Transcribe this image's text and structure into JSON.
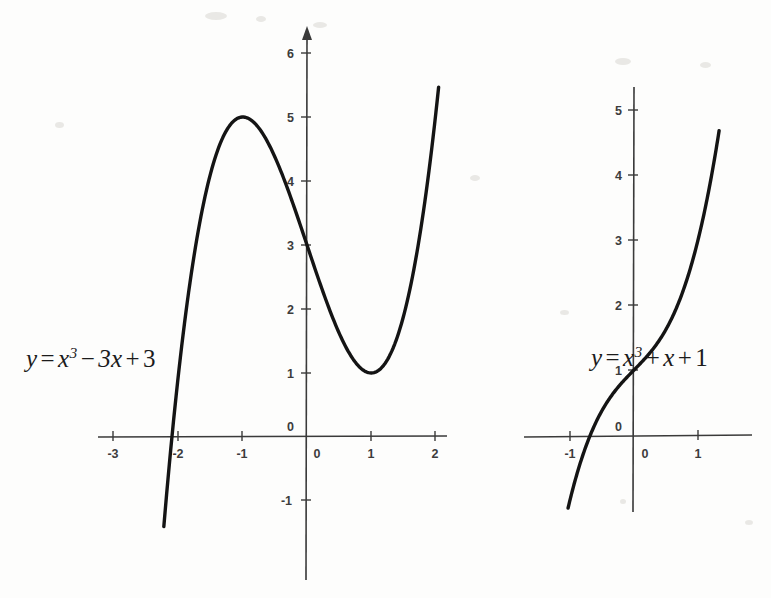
{
  "figure": {
    "background_color": "#fdfdfc",
    "curve_color": "#141414",
    "axis_color": "#3a3a3a",
    "label_color": "#3c3c3c"
  },
  "chart_data": [
    {
      "type": "line",
      "id": "left-plot",
      "title": "",
      "annotation": "y = x^3 - 3x + 3",
      "equation_parts": {
        "lhs": "y",
        "equals": "=",
        "var": "x",
        "exponent": "3",
        "term2_op": "−",
        "term2": "3x",
        "term3_op": "+",
        "term3": "3"
      },
      "function": "x^3-3x+3",
      "xlabel": "",
      "ylabel": "",
      "xlim": [
        -3.25,
        2.15
      ],
      "ylim": [
        -2.4,
        6.6
      ],
      "xticks": [
        -3,
        -2,
        -1,
        0,
        1,
        2
      ],
      "xticklabels": [
        "-3",
        "-2",
        "-1",
        "0",
        "1",
        "2"
      ],
      "yticks": [
        -1,
        0,
        1,
        2,
        3,
        4,
        5,
        6
      ],
      "yticklabels": [
        "-1",
        "0",
        "1",
        "2",
        "3",
        "4",
        "5",
        "6"
      ],
      "grid": false,
      "legend": "none",
      "axis_arrow_y": true,
      "domain_drawn": [
        -2.23,
        2.05
      ],
      "key_points": [
        {
          "label": "local maximum",
          "x": -1,
          "y": 5
        },
        {
          "label": "local minimum",
          "x": 1,
          "y": 1
        },
        {
          "label": "y-intercept",
          "x": 0,
          "y": 3
        },
        {
          "label": "x-intercept",
          "x": -2.1,
          "y": 0
        }
      ],
      "x": [
        -2.23,
        -2.0,
        -1.75,
        -1.5,
        -1.25,
        -1.0,
        -0.75,
        -0.5,
        -0.25,
        0.0,
        0.25,
        0.5,
        0.75,
        1.0,
        1.25,
        1.5,
        1.75,
        2.0,
        2.05
      ],
      "values": [
        -1.4,
        1.0,
        2.89,
        4.13,
        4.8,
        5.0,
        4.83,
        4.38,
        3.73,
        3.0,
        2.27,
        1.63,
        1.17,
        1.0,
        1.2,
        1.88,
        3.11,
        5.0,
        5.46
      ]
    },
    {
      "type": "line",
      "id": "right-plot",
      "title": "",
      "annotation": "y = x^3 + x + 1",
      "equation_parts": {
        "lhs": "y",
        "equals": "=",
        "var": "x",
        "exponent": "3",
        "term2_op": "+",
        "term2": "x",
        "term3_op": "+",
        "term3": "1"
      },
      "function": "x^3+x+1",
      "xlabel": "",
      "ylabel": "",
      "xlim": [
        -1.7,
        1.8
      ],
      "ylim": [
        -1.5,
        5.7
      ],
      "xticks": [
        -1,
        0,
        1
      ],
      "xticklabels": [
        "-1",
        "0",
        "1"
      ],
      "yticks": [
        0,
        1,
        2,
        3,
        4,
        5
      ],
      "yticklabels": [
        "0",
        "1",
        "2",
        "3",
        "4",
        "5"
      ],
      "grid": false,
      "legend": "none",
      "axis_arrow_y": false,
      "domain_drawn": [
        -1.03,
        1.33
      ],
      "key_points": [
        {
          "label": "y-intercept",
          "x": 0,
          "y": 1
        },
        {
          "label": "x-intercept",
          "x": -0.68,
          "y": 0
        },
        {
          "label": "inflection",
          "x": 0,
          "y": 1
        }
      ],
      "x": [
        -1.03,
        -0.9,
        -0.75,
        -0.6,
        -0.45,
        -0.3,
        -0.15,
        0.0,
        0.15,
        0.3,
        0.45,
        0.6,
        0.75,
        0.9,
        1.05,
        1.2,
        1.33
      ],
      "values": [
        -1.12,
        -0.63,
        -0.17,
        0.18,
        0.46,
        0.67,
        0.85,
        1.0,
        1.15,
        1.33,
        1.54,
        1.82,
        2.17,
        2.63,
        3.21,
        3.93,
        4.68
      ]
    }
  ],
  "left_plot": {
    "equation_text": "y = x³ − 3x + 3",
    "xticklabels": [
      "-3",
      "-2",
      "-1",
      "0",
      "1",
      "2"
    ],
    "yticklabels": [
      "-1",
      "0",
      "1",
      "2",
      "3",
      "4",
      "5",
      "6"
    ],
    "origin_label": "0"
  },
  "right_plot": {
    "equation_text": "y = x³ + x + 1",
    "xticklabels": [
      "-1",
      "0",
      "1"
    ],
    "yticklabels": [
      "0",
      "1",
      "2",
      "3",
      "4",
      "5"
    ],
    "origin_label": "0"
  }
}
